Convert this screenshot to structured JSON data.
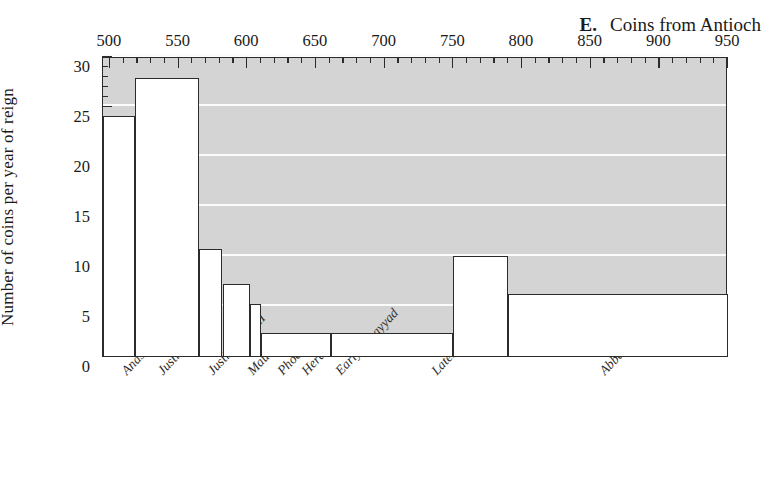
{
  "panel": {
    "letter": "E.",
    "title": "Coins from Antioch"
  },
  "axes": {
    "y_title": "Number of coins per year of reign",
    "y_ticks": [
      0,
      5,
      10,
      15,
      20,
      25,
      30
    ],
    "y_minor_step": 1,
    "x_ticks": [
      500,
      550,
      600,
      650,
      700,
      750,
      800,
      850,
      900,
      950
    ],
    "x_minor_step": 10,
    "xlim": [
      495,
      950
    ],
    "ylim": [
      0,
      30
    ],
    "grid": "horizontal-major",
    "plot_bg": "#d4d4d4",
    "grid_color": "#fbfbfb",
    "axis_color": "#2b2b2b",
    "bar_fill": "#ffffff"
  },
  "chart_data": {
    "type": "bar",
    "xlabel": "",
    "ylabel": "Number of coins per year of reign",
    "xlim": [
      495,
      950
    ],
    "ylim": [
      0,
      30
    ],
    "grid": true,
    "legend": "none",
    "categories": [
      "Anastasius",
      "Justin/Justinian",
      "Justin II/Tib.II",
      "Maurice",
      "Phocas",
      "Heraclius",
      "Early Umayyad",
      "Later Umayyad",
      "Abbasid"
    ],
    "bins": [
      {
        "label": "Anastasius",
        "start": 495,
        "end": 518,
        "value": 24.0
      },
      {
        "label": "Justin/Justinian",
        "start": 518,
        "end": 565,
        "value": 27.8
      },
      {
        "label": "Justin II/Tib.II",
        "start": 565,
        "end": 582,
        "value": 10.7
      },
      {
        "label": "Maurice",
        "start": 582,
        "end": 602,
        "value": 7.2
      },
      {
        "label": "Phocas",
        "start": 602,
        "end": 610,
        "value": 5.2
      },
      {
        "label": "Heraclius",
        "start": 610,
        "end": 661,
        "value": 2.3
      },
      {
        "label": "Early Umayyad",
        "start": 661,
        "end": 750,
        "value": 2.3
      },
      {
        "label": "Later Umayyad",
        "start": 750,
        "end": 790,
        "value": 10.0
      },
      {
        "label": "Abbasid",
        "start": 790,
        "end": 950,
        "value": 6.2
      }
    ],
    "values": [
      24.0,
      27.8,
      10.7,
      7.2,
      5.2,
      2.3,
      2.3,
      10.0,
      6.2
    ]
  },
  "category_labels": [
    {
      "text": "Anastasius",
      "x": 22,
      "y": 8
    },
    {
      "text": "Justin/Justinian",
      "x": 58,
      "y": 8
    },
    {
      "text": "Justin II/Tib.II",
      "x": 108,
      "y": 8
    },
    {
      "text": "Maurice",
      "x": 148,
      "y": 8
    },
    {
      "text": "Phocas",
      "x": 178,
      "y": 8
    },
    {
      "text": "Heraclius",
      "x": 202,
      "y": 8
    },
    {
      "text": "Early Umayyad",
      "x": 236,
      "y": 8
    },
    {
      "text": "Later Umayyad",
      "x": 332,
      "y": 8
    },
    {
      "text": "Abbasid",
      "x": 500,
      "y": 8
    }
  ]
}
